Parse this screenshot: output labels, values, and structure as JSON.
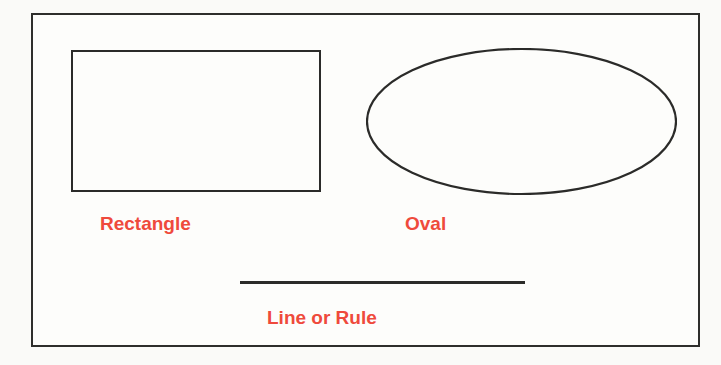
{
  "diagram": {
    "background_color": "#fafaf8",
    "frame": {
      "name": "outer-frame",
      "stroke_color": "#2e2e2c",
      "stroke_width": 2,
      "fill_color": "#fdfdfb"
    },
    "accent_color": "#ef4a3c",
    "stroke_color": "#2b2b29",
    "shapes": [
      {
        "id": "rectangle",
        "kind": "rectangle",
        "label": "Rectangle",
        "x": 69,
        "y": 48,
        "width": 250,
        "height": 142,
        "stroke_color": "#2b2b29",
        "stroke_width": 2,
        "fill": "none"
      },
      {
        "id": "oval",
        "kind": "ellipse",
        "label": "Oval",
        "x": 364,
        "y": 46,
        "width": 311,
        "height": 147,
        "stroke_color": "#2b2b29",
        "stroke_width": 2,
        "fill": "none"
      },
      {
        "id": "line",
        "kind": "line",
        "label": "Line or Rule",
        "x": 238,
        "y": 279,
        "width": 285,
        "height": 3,
        "stroke_color": "#2b2b29",
        "stroke_width": 3,
        "fill": "none"
      }
    ],
    "labels": {
      "rectangle": "Rectangle",
      "oval": "Oval",
      "line": "Line or Rule"
    }
  }
}
